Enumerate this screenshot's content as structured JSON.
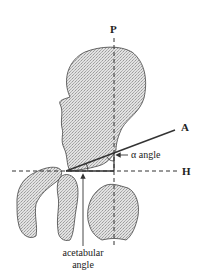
{
  "diagram": {
    "title": "",
    "type": "anatomical-hip-angle-diagram",
    "labels": {
      "vertical_line": "P",
      "horizontal_line": "H",
      "acetabular_roof_line": "A",
      "alpha_angle": "α angle",
      "acetabular_angle_line1": "acetabular",
      "acetabular_angle_line2": "angle"
    },
    "colors": {
      "background": "#ffffff",
      "bone_fill": "#d9d9d9",
      "line": "#333333",
      "text": "#222222"
    },
    "elements": [
      {
        "name": "femoral-head-ilium",
        "kind": "bone"
      },
      {
        "name": "left-bone-fragment",
        "kind": "bone"
      },
      {
        "name": "femur-shaft",
        "kind": "bone"
      },
      {
        "name": "right-bone-fragment",
        "kind": "bone"
      },
      {
        "name": "vertical-reference-line-P",
        "kind": "dashed-line"
      },
      {
        "name": "horizontal-reference-line-H",
        "kind": "dashed-line"
      },
      {
        "name": "line-A",
        "kind": "solid-line"
      },
      {
        "name": "alpha-angle-arc",
        "kind": "arc"
      },
      {
        "name": "acetabular-angle-arc",
        "kind": "arc"
      },
      {
        "name": "acetabular-angle-arrow",
        "kind": "arrow"
      }
    ]
  }
}
